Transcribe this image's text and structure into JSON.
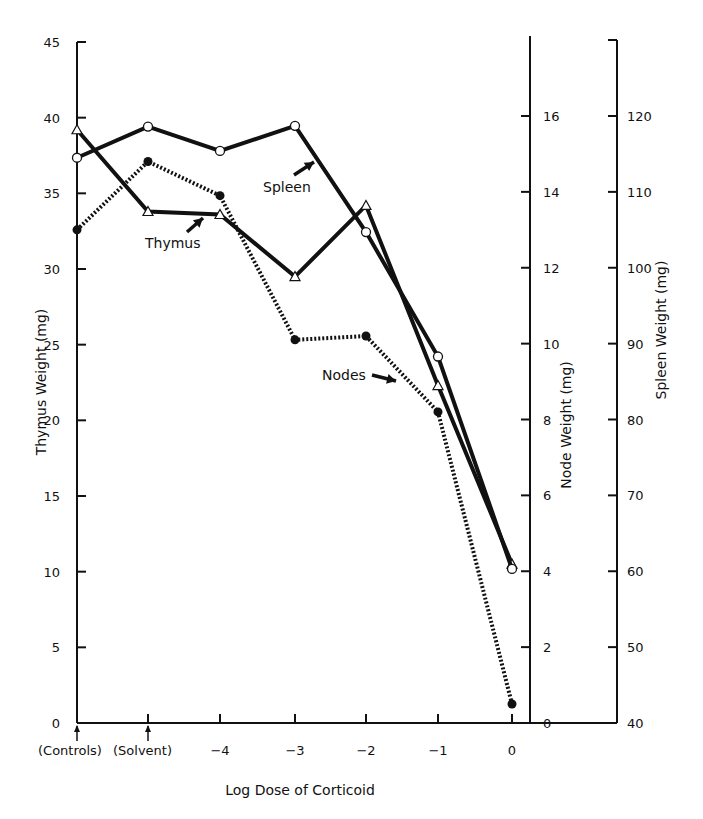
{
  "chart_data": {
    "type": "line",
    "title": "",
    "xlabel": "Log Dose of Corticoid",
    "categories": [
      "(Controls)",
      "(Solvent)",
      "-4",
      "-3",
      "-2",
      "-1",
      "0"
    ],
    "axes": {
      "left": {
        "label": "Thymus Weight (mg)",
        "range": [
          0,
          45
        ],
        "ticks": [
          0,
          5,
          10,
          15,
          20,
          25,
          30,
          35,
          40,
          45
        ]
      },
      "right_inner": {
        "label": "Node Weight (mg)",
        "range": [
          0,
          16
        ],
        "ticks": [
          0,
          2,
          4,
          6,
          8,
          10,
          12,
          14,
          16
        ]
      },
      "right_outer": {
        "label": "Spleen Weight (mg)",
        "range": [
          40,
          120
        ],
        "ticks": [
          40,
          50,
          60,
          70,
          80,
          90,
          100,
          110,
          120
        ]
      }
    },
    "series": [
      {
        "name": "Thymus",
        "axis": "left",
        "marker": "open-triangle",
        "line": "solid",
        "values": [
          39.2,
          33.8,
          33.6,
          29.5,
          34.2,
          22.3,
          10.5
        ]
      },
      {
        "name": "Spleen",
        "axis": "right_outer",
        "marker": "open-circle",
        "line": "solid",
        "values": [
          114.5,
          118.6,
          115.4,
          118.7,
          104.7,
          88.3,
          60.3
        ]
      },
      {
        "name": "Nodes",
        "axis": "right_inner",
        "marker": "filled-circle",
        "line": "dotted",
        "values": [
          13.0,
          14.8,
          13.9,
          10.1,
          10.2,
          8.2,
          0.5
        ]
      }
    ],
    "annotations": [
      "Thymus",
      "Spleen",
      "Nodes"
    ],
    "grid": false,
    "legend": "none (inline arrow annotations)"
  },
  "labels": {
    "xlabel": "Log Dose of Corticoid",
    "left_axis": "Thymus Weight (mg)",
    "node_axis": "Node Weight (mg)",
    "spleen_axis": "Spleen Weight (mg)",
    "thymus_annot": "Thymus",
    "spleen_annot": "Spleen",
    "nodes_annot": "Nodes"
  }
}
